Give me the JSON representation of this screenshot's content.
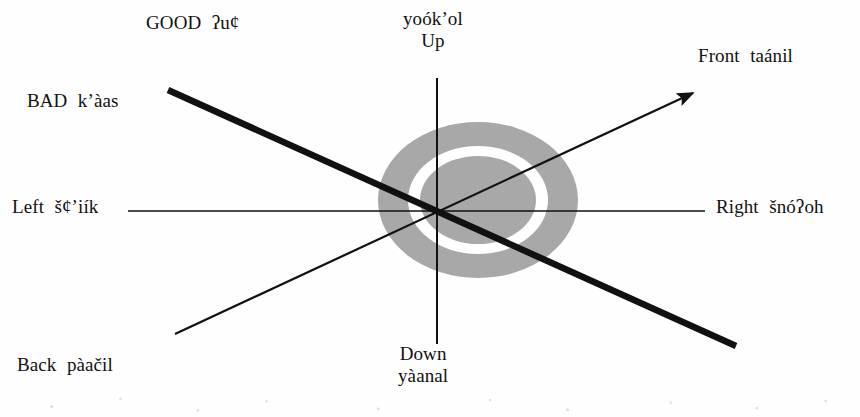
{
  "figure": {
    "colors": {
      "line": "#111111",
      "shade_gray": "#a8a8a8",
      "ring_white": "#ffffff",
      "background": "#fefefe"
    },
    "axes": [
      {
        "id": "vertical",
        "name": "up-down-axis",
        "type": "thin-line",
        "positive_label": "Up",
        "negative_label": "Down"
      },
      {
        "id": "horizontal",
        "name": "left-right-axis",
        "type": "thin-line",
        "positive_label": "Right",
        "negative_label": "Left"
      },
      {
        "id": "front-back",
        "name": "front-back-axis",
        "type": "thin-arrow",
        "positive_label": "Front",
        "negative_label": "Back"
      },
      {
        "id": "good-bad",
        "name": "good-bad-axis",
        "type": "thick-line",
        "positive_label": "GOOD",
        "negative_label": "BAD"
      }
    ],
    "labels": {
      "good": {
        "english": "GOOD",
        "gloss": "ʔu¢"
      },
      "bad": {
        "english": "BAD",
        "gloss": "k’àas"
      },
      "left": {
        "english": "Left",
        "gloss": "š¢’iík"
      },
      "right": {
        "english": "Right",
        "gloss": "šnóʔoh"
      },
      "front": {
        "english": "Front",
        "gloss": "taánil"
      },
      "back": {
        "english": "Back",
        "gloss": "pàačil"
      },
      "up": {
        "english": "Up",
        "gloss": "yoók’ol"
      },
      "down": {
        "english": "Down",
        "gloss": "yàanal"
      }
    },
    "center_shape": {
      "name": "target-ellipse",
      "description": "concentric shaded ellipse with white ring"
    }
  }
}
